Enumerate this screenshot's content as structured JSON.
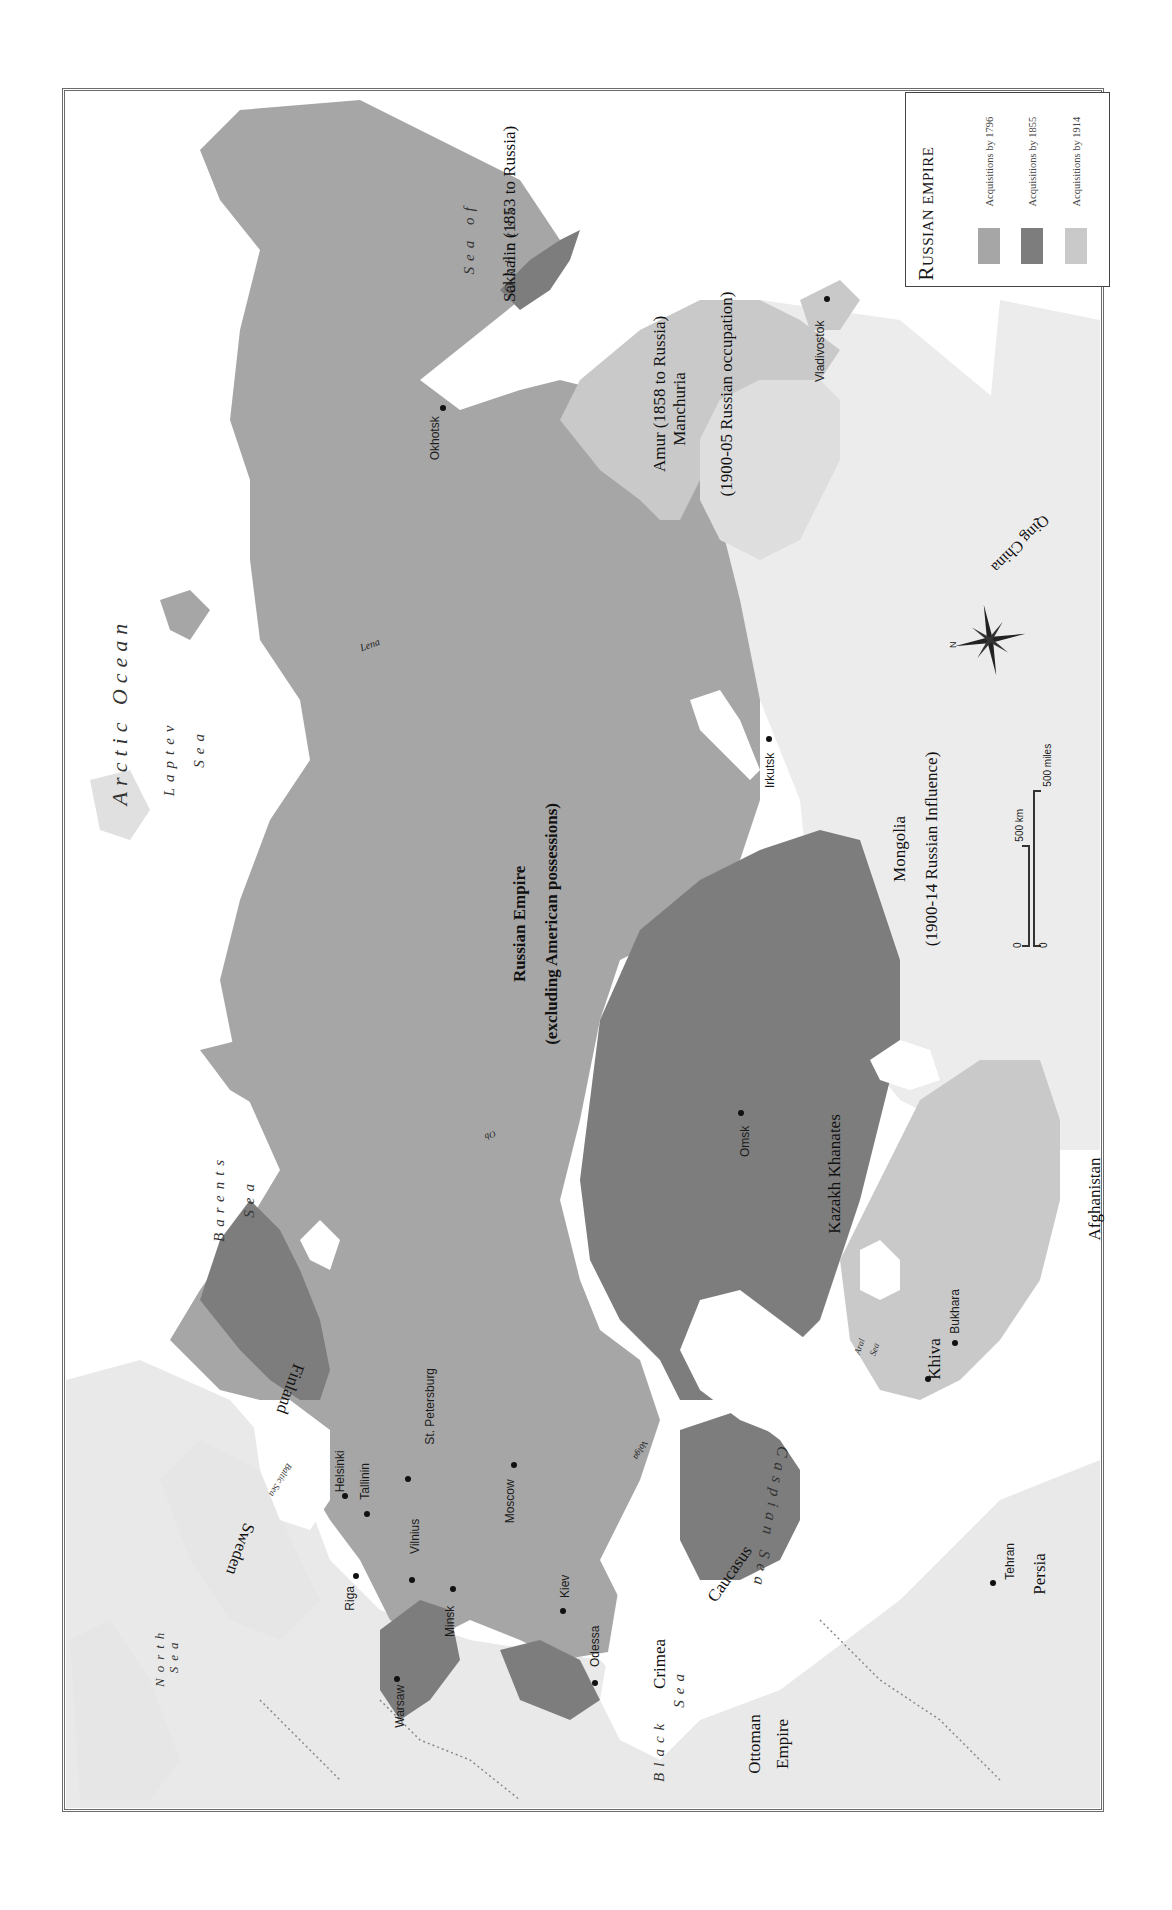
{
  "legend": {
    "title_cap": "R",
    "title_rest": "USSIAN EMPIRE",
    "items": [
      {
        "label": "Acquisitions by 1796",
        "color": "#a6a6a6"
      },
      {
        "label": "Acquisitions by 1855",
        "color": "#7d7d7d"
      },
      {
        "label": "Acquisitions by 1914",
        "color": "#c9c9c9"
      }
    ]
  },
  "colors": {
    "empire_1796": "#a6a6a6",
    "acq_1855": "#7d7d7d",
    "acq_1914": "#c9c9c9",
    "foreign_land": "#e9e9e9",
    "water": "#ffffff",
    "frame": "#6a6a6a"
  },
  "seas": {
    "arctic": "Arctic Ocean",
    "laptev_1": "Laptev",
    "laptev_2": "Sea",
    "barents_1": "Barents",
    "barents_2": "Sea",
    "okhotsk_1": "Sea of",
    "okhotsk_2": "Okhotsk",
    "north_1": "North",
    "north_2": "Sea",
    "baltic": "Baltic Sea",
    "black_1": "Black",
    "black_2": "Sea",
    "caspian": "Caspian Sea",
    "aral_1": "Aral",
    "aral_2": "Sea"
  },
  "rivers": {
    "lena": "Lena",
    "ob": "Ob",
    "volga": "Volga"
  },
  "regions": {
    "russian_empire_1": "Russian  Empire",
    "russian_empire_2": "(excluding American possessions)",
    "sakhalin": "Sakhalin (1853 to Russia)",
    "amur": "Amur (1858 to Russia)",
    "manchuria_1": "Manchuria",
    "manchuria_2": "(1900-05 Russian occupation)",
    "mongolia_1": "Mongolia",
    "mongolia_2": "(1900-14 Russian Influence)",
    "qing": "Qing China",
    "kazakh": "Kazakh Khanates",
    "khiva": "Khiva",
    "afghanistan": "Afghanistan",
    "persia": "Persia",
    "caucasus": "Caucasus",
    "crimea": "Crimea",
    "ottoman_1": "Ottoman",
    "ottoman_2": "Empire",
    "finland": "Finland",
    "sweden": "Sweden"
  },
  "cities": {
    "okhotsk": "Okhotsk",
    "vladivostok": "Vladivostok",
    "irkutsk": "Irkutsk",
    "omsk": "Omsk",
    "bukhara": "Bukhara",
    "tehran": "Tehran",
    "helsinki": "Helsinki",
    "tallinn": "Tallinin",
    "st_petersburg": "St. Petersburg",
    "riga": "Riga",
    "vilnius": "Vilnius",
    "moscow": "Moscow",
    "minsk": "Minsk",
    "kiev": "Kiev",
    "odessa": "Odessa",
    "warsaw": "Warsaw"
  },
  "scale_bar": {
    "km_zero": "0",
    "km_label": "500 km",
    "mi_zero": "0",
    "mi_label": "500 miles"
  },
  "compass": {
    "north_label": "N"
  }
}
